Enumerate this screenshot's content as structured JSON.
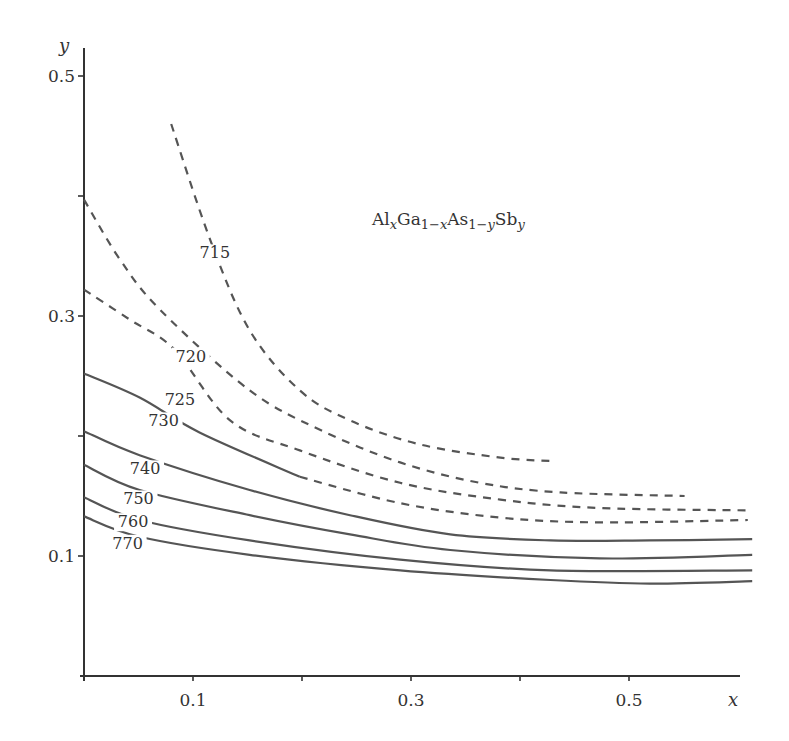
{
  "chart_data": {
    "type": "line",
    "subtype": "contour",
    "title_parts": [
      {
        "t": "Al",
        "sub": false
      },
      {
        "t": "x",
        "sub": true,
        "italic": true
      },
      {
        "t": "Ga",
        "sub": false
      },
      {
        "t": "1−",
        "sub": true
      },
      {
        "t": "x",
        "sub": true,
        "italic": true
      },
      {
        "t": "As",
        "sub": false
      },
      {
        "t": "1−",
        "sub": true
      },
      {
        "t": "y",
        "sub": true,
        "italic": true
      },
      {
        "t": "Sb",
        "sub": false
      },
      {
        "t": "y",
        "sub": true,
        "italic": true
      }
    ],
    "xlabel": "x",
    "ylabel": "y",
    "xlim": [
      0,
      0.6
    ],
    "ylim": [
      0,
      0.5
    ],
    "x_ticks": [
      {
        "value": 0.1,
        "label": "0.1"
      },
      {
        "value": 0.2,
        "label": ""
      },
      {
        "value": 0.3,
        "label": "0.3"
      },
      {
        "value": 0.4,
        "label": ""
      },
      {
        "value": 0.5,
        "label": "0.5"
      }
    ],
    "y_ticks": [
      {
        "value": 0.1,
        "label": "0.1"
      },
      {
        "value": 0.2,
        "label": ""
      },
      {
        "value": 0.3,
        "label": "0.3"
      },
      {
        "value": 0.4,
        "label": ""
      },
      {
        "value": 0.5,
        "label": "0.5"
      }
    ],
    "grid": false,
    "legend": "none",
    "series": [
      {
        "name": "715",
        "style": "dashed",
        "label_pos": [
          0.12,
          0.348
        ],
        "x": [
          0.08,
          0.116,
          0.152,
          0.198,
          0.244,
          0.308,
          0.382,
          0.431
        ],
        "y": [
          0.46,
          0.363,
          0.288,
          0.238,
          0.213,
          0.193,
          0.182,
          0.179
        ]
      },
      {
        "name": "720",
        "style": "dashed",
        "label_pos": [
          0.098,
          0.262
        ],
        "x": [
          0.0,
          0.033,
          0.07,
          0.152,
          0.217,
          0.29,
          0.363,
          0.437,
          0.551
        ],
        "y": [
          0.397,
          0.347,
          0.305,
          0.238,
          0.205,
          0.178,
          0.161,
          0.153,
          0.15
        ]
      },
      {
        "name": "725",
        "style": "dashed",
        "label_pos": [
          0.088,
          0.226
        ],
        "x": [
          0.0,
          0.042,
          0.083,
          0.134,
          0.198,
          0.29,
          0.382,
          0.473,
          0.613
        ],
        "y": [
          0.322,
          0.297,
          0.272,
          0.213,
          0.188,
          0.161,
          0.147,
          0.14,
          0.138
        ]
      },
      {
        "name": "730",
        "style": "solid-then-dashed",
        "solid_until_x": 0.198,
        "label_pos": [
          0.073,
          0.208
        ],
        "x": [
          0.0,
          0.051,
          0.106,
          0.198,
          0.29,
          0.382,
          0.473,
          0.609
        ],
        "y": [
          0.252,
          0.232,
          0.203,
          0.166,
          0.144,
          0.132,
          0.128,
          0.13
        ]
      },
      {
        "name": "740",
        "style": "solid",
        "label_pos": [
          0.056,
          0.168
        ],
        "x": [
          0.0,
          0.051,
          0.152,
          0.244,
          0.336,
          0.428,
          0.519,
          0.613
        ],
        "y": [
          0.204,
          0.184,
          0.155,
          0.134,
          0.118,
          0.113,
          0.113,
          0.114
        ]
      },
      {
        "name": "750",
        "style": "solid",
        "label_pos": [
          0.05,
          0.143
        ],
        "x": [
          0.0,
          0.051,
          0.152,
          0.244,
          0.336,
          0.473,
          0.613
        ],
        "y": [
          0.176,
          0.155,
          0.134,
          0.118,
          0.105,
          0.098,
          0.101
        ]
      },
      {
        "name": "760",
        "style": "solid",
        "label_pos": [
          0.045,
          0.124
        ],
        "x": [
          0.0,
          0.051,
          0.152,
          0.29,
          0.428,
          0.613
        ],
        "y": [
          0.149,
          0.13,
          0.113,
          0.097,
          0.088,
          0.088
        ]
      },
      {
        "name": "770",
        "style": "solid",
        "label_pos": [
          0.04,
          0.106
        ],
        "x": [
          0.0,
          0.051,
          0.152,
          0.29,
          0.428,
          0.519,
          0.613
        ],
        "y": [
          0.133,
          0.116,
          0.101,
          0.088,
          0.08,
          0.077,
          0.079
        ]
      }
    ]
  },
  "colors": {
    "axis": "#333333",
    "curve": "#555555",
    "text": "#333333",
    "background": "#ffffff"
  }
}
